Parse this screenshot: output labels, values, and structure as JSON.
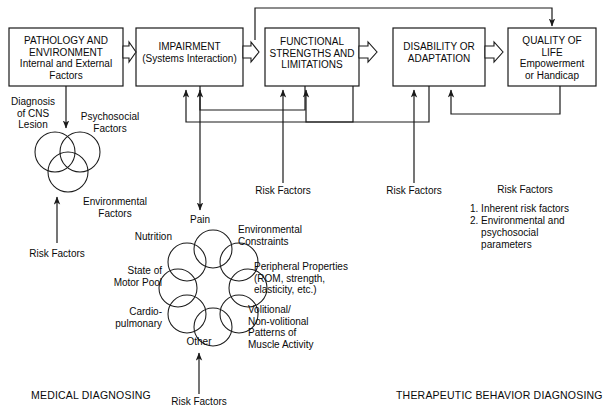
{
  "diagram": {
    "title_stage_boxes": [
      {
        "id": "pathology",
        "lines": "PATHOLOGY AND\nENVIRONMENT\nInternal and External\nFactors"
      },
      {
        "id": "impairment",
        "lines": "IMPAIRMENT\n(Systems Interaction)"
      },
      {
        "id": "functional",
        "lines": "FUNCTIONAL\nSTRENGTHS AND\nLIMITATIONS"
      },
      {
        "id": "disability",
        "lines": "DISABILITY OR\nADAPTATION"
      },
      {
        "id": "quality",
        "lines": "QUALITY OF\nLIFE\nEmpowerment\nor Handicap"
      }
    ],
    "venn_labels": {
      "diagnosis": "Diagnosis\nof CNS\nLesion",
      "psychosocial": "Psychosocial\nFactors",
      "environmental": "Environmental\nFactors",
      "risk_factors": "Risk Factors"
    },
    "flower_labels": {
      "pain": "Pain",
      "nutrition": "Nutrition",
      "state_of_motor_pool": "State of\nMotor Pool",
      "cardiopulmonary": "Cardio-\npulmonary",
      "other": "Other",
      "environmental_constraints": "Environmental\nConstraints",
      "peripheral_properties": "Peripheral Properties\n(ROM, strength,\nelasticity, etc.)",
      "volitional": "Volitional/\nNon-volitional\nPatterns of\nMuscle Activity",
      "risk_factors": "Risk Factors"
    },
    "risk_factor_labels": {
      "under_functional": "Risk Factors",
      "under_disability": "Risk Factors"
    },
    "risk_factors_legend": {
      "heading": "Risk Factors",
      "items": [
        "1. Inherent risk factors",
        "2. Environmental and",
        "    psychosocial",
        "    parameters"
      ]
    },
    "footers": {
      "left": "MEDICAL DIAGNOSING",
      "right": "THERAPEUTIC BEHAVIOR DIAGNOSING"
    },
    "colors": {
      "stroke": "#1a1a1a",
      "text": "#0a0a0a",
      "background": "#ffffff"
    }
  }
}
